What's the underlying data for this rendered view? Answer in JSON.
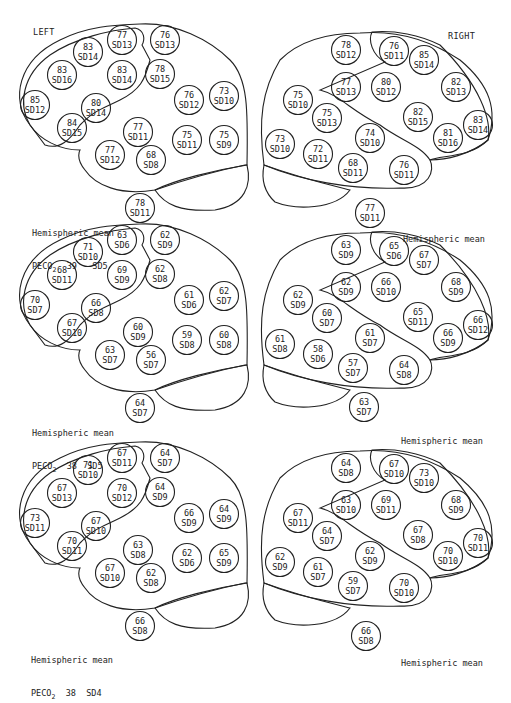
{
  "headers": {
    "left": "LEFT",
    "right": "RIGHT"
  },
  "colors": {
    "ink": "#222222",
    "background": "#ffffff"
  },
  "panels": [
    {
      "left": {
        "mean_label": "Hemispheric mean",
        "peco2_label": "PECO",
        "peco2_sub": "2",
        "peco2_value": "39",
        "peco2_sd": "SD5",
        "mean_value": "78",
        "mean_sd": "SD11",
        "regions": [
          {
            "v": "77",
            "sd": "SD13"
          },
          {
            "v": "76",
            "sd": "SD13"
          },
          {
            "v": "83",
            "sd": "SD14"
          },
          {
            "v": "83",
            "sd": "SD16"
          },
          {
            "v": "83",
            "sd": "SD14"
          },
          {
            "v": "78",
            "sd": "SD15"
          },
          {
            "v": "85",
            "sd": "SD12"
          },
          {
            "v": "80",
            "sd": "SD14"
          },
          {
            "v": "84",
            "sd": "SD15"
          },
          {
            "v": "76",
            "sd": "SD12"
          },
          {
            "v": "73",
            "sd": "SD10"
          },
          {
            "v": "77",
            "sd": "SD11"
          },
          {
            "v": "75",
            "sd": "SD11"
          },
          {
            "v": "75",
            "sd": "SD9"
          },
          {
            "v": "77",
            "sd": "SD12"
          },
          {
            "v": "68",
            "sd": "SD8"
          }
        ]
      },
      "right": {
        "mean_label": "Hemispheric mean",
        "mean_value": "77",
        "mean_sd": "SD11",
        "regions": [
          {
            "v": "78",
            "sd": "SD12"
          },
          {
            "v": "76",
            "sd": "SD11"
          },
          {
            "v": "85",
            "sd": "SD14"
          },
          {
            "v": "77",
            "sd": "SD13"
          },
          {
            "v": "80",
            "sd": "SD12"
          },
          {
            "v": "82",
            "sd": "SD13"
          },
          {
            "v": "75",
            "sd": "SD10"
          },
          {
            "v": "75",
            "sd": "SD13"
          },
          {
            "v": "82",
            "sd": "SD15"
          },
          {
            "v": "83",
            "sd": "SD14"
          },
          {
            "v": "81",
            "sd": "SD16"
          },
          {
            "v": "73",
            "sd": "SD10"
          },
          {
            "v": "72",
            "sd": "SD11"
          },
          {
            "v": "74",
            "sd": "SD10"
          },
          {
            "v": "68",
            "sd": "SD11"
          },
          {
            "v": "76",
            "sd": "SD11"
          }
        ]
      }
    },
    {
      "left": {
        "mean_label": "Hemispheric mean",
        "peco2_label": "PECO",
        "peco2_sub": "2",
        "peco2_value": "38",
        "peco2_sd": "SD5",
        "mean_value": "64",
        "mean_sd": "SD7",
        "regions": [
          {
            "v": "63",
            "sd": "SD6"
          },
          {
            "v": "62",
            "sd": "SD9"
          },
          {
            "v": "71",
            "sd": "SD10"
          },
          {
            "v": "68",
            "sd": "SD11"
          },
          {
            "v": "69",
            "sd": "SD9"
          },
          {
            "v": "62",
            "sd": "SD8"
          },
          {
            "v": "70",
            "sd": "SD7"
          },
          {
            "v": "66",
            "sd": "SD8"
          },
          {
            "v": "67",
            "sd": "SD10"
          },
          {
            "v": "61",
            "sd": "SD6"
          },
          {
            "v": "62",
            "sd": "SD7"
          },
          {
            "v": "60",
            "sd": "SD9"
          },
          {
            "v": "59",
            "sd": "SD8"
          },
          {
            "v": "60",
            "sd": "SD8"
          },
          {
            "v": "63",
            "sd": "SD7"
          },
          {
            "v": "56",
            "sd": "SD7"
          }
        ]
      },
      "right": {
        "mean_label": "Hemispheric mean",
        "mean_value": "63",
        "mean_sd": "SD7",
        "regions": [
          {
            "v": "63",
            "sd": "SD9"
          },
          {
            "v": "65",
            "sd": "SD6"
          },
          {
            "v": "67",
            "sd": "SD7"
          },
          {
            "v": "62",
            "sd": "SD9"
          },
          {
            "v": "66",
            "sd": "SD10"
          },
          {
            "v": "68",
            "sd": "SD9"
          },
          {
            "v": "62",
            "sd": "SD9"
          },
          {
            "v": "60",
            "sd": "SD7"
          },
          {
            "v": "65",
            "sd": "SD11"
          },
          {
            "v": "66",
            "sd": "SD12"
          },
          {
            "v": "66",
            "sd": "SD9"
          },
          {
            "v": "61",
            "sd": "SD8"
          },
          {
            "v": "58",
            "sd": "SD6"
          },
          {
            "v": "61",
            "sd": "SD7"
          },
          {
            "v": "57",
            "sd": "SD7"
          },
          {
            "v": "64",
            "sd": "SD8"
          }
        ]
      }
    },
    {
      "left": {
        "mean_label": "Hemispheric mean",
        "peco2_label": "PECO",
        "peco2_sub": "2",
        "peco2_value": "38",
        "peco2_sd": "SD4",
        "mean_value": "66",
        "mean_sd": "SD8",
        "regions": [
          {
            "v": "67",
            "sd": "SD11"
          },
          {
            "v": "64",
            "sd": "SD7"
          },
          {
            "v": "71",
            "sd": "SD10"
          },
          {
            "v": "67",
            "sd": "SD13"
          },
          {
            "v": "70",
            "sd": "SD12"
          },
          {
            "v": "64",
            "sd": "SD9"
          },
          {
            "v": "73",
            "sd": "SD11"
          },
          {
            "v": "67",
            "sd": "SD10"
          },
          {
            "v": "70",
            "sd": "SD11"
          },
          {
            "v": "66",
            "sd": "SD9"
          },
          {
            "v": "64",
            "sd": "SD9"
          },
          {
            "v": "63",
            "sd": "SD8"
          },
          {
            "v": "62",
            "sd": "SD6"
          },
          {
            "v": "65",
            "sd": "SD9"
          },
          {
            "v": "67",
            "sd": "SD10"
          },
          {
            "v": "62",
            "sd": "SD8"
          }
        ]
      },
      "right": {
        "mean_label": "Hemispheric mean",
        "mean_value": "66",
        "mean_sd": "SD8",
        "regions": [
          {
            "v": "64",
            "sd": "SD8"
          },
          {
            "v": "67",
            "sd": "SD10"
          },
          {
            "v": "73",
            "sd": "SD10"
          },
          {
            "v": "63",
            "sd": "SD10"
          },
          {
            "v": "69",
            "sd": "SD11"
          },
          {
            "v": "68",
            "sd": "SD9"
          },
          {
            "v": "67",
            "sd": "SD11"
          },
          {
            "v": "64",
            "sd": "SD7"
          },
          {
            "v": "67",
            "sd": "SD8"
          },
          {
            "v": "70",
            "sd": "SD11"
          },
          {
            "v": "70",
            "sd": "SD10"
          },
          {
            "v": "62",
            "sd": "SD9"
          },
          {
            "v": "61",
            "sd": "SD7"
          },
          {
            "v": "62",
            "sd": "SD9"
          },
          {
            "v": "59",
            "sd": "SD7"
          },
          {
            "v": "70",
            "sd": "SD10"
          }
        ]
      }
    }
  ]
}
